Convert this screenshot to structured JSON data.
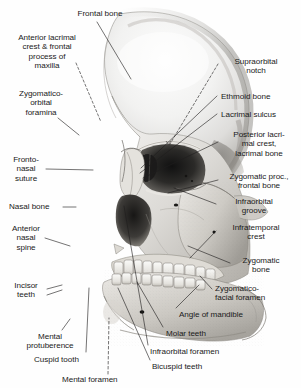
{
  "figure": {
    "type": "anatomical-illustration",
    "style": "grayscale halftone medical drawing with leader-line callouts",
    "background_color": "#ffffff",
    "ink_color": "#1a1a1a",
    "label_count": 22
  },
  "labels": {
    "frontal_bone": "Frontal bone",
    "anterior_lacrimal_crest": "Anterior lacrimal\ncrest & frontal\nprocess of\nmaxilla",
    "zygomatico_orbital_foramina": "Zygomatico-\norbital\nforamina",
    "fronto_nasal_suture": "Fronto-\nnasal\nsuture",
    "nasal_bone": "Nasal bone",
    "anterior_nasal_spine": "Anterior\nnasal\nspine",
    "incisor_teeth": "Incisor\nteeth",
    "mental_protuberence": "Mental\nprotuberence",
    "cuspid_tooth": "Cuspid tooth",
    "mental_foramen": "Mental foramen",
    "bicuspid_teeth": "Bicuspid teeth",
    "infraorbital_foramen": "Infraorbital foramen",
    "molar_teeth": "Molar teeth",
    "angle_of_mandible": "Angle of mandible",
    "zygomatico_facial_foramen": "Zygomatico-\nfacial foramen",
    "zygomatic_bone": "Zygomatic\nbone",
    "infratemporal_crest": "Infratemporal\ncrest",
    "infraorbital_groove": "Infraorbital\ngroove",
    "zygomatic_proc_frontal_bone": "Zygomatic proc.,\nfrontal bone",
    "posterior_lacrimal_crest": "Posterior lacri-\nmal crest,\nlacrimal bone",
    "lacrimal_sulcus": "Lacrimal sulcus",
    "ethmoid_bone": "Ethmoid bone",
    "supraorbital_notch": "Supraorbital\nnotch"
  }
}
